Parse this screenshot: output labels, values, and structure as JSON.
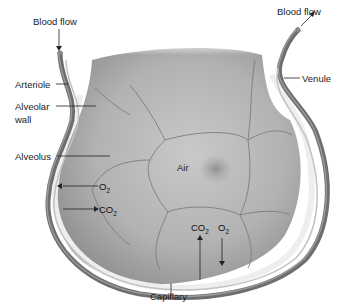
{
  "diagram": {
    "labels": {
      "blood_flow_in": "Blood flow",
      "blood_flow_out": "Blood flow",
      "arteriole": "Arteriole",
      "alveolar_wall_line1": "Alveolar",
      "alveolar_wall_line2": "wall",
      "alveolus": "Alveolus",
      "air": "Air",
      "venule": "Venule",
      "capillary": "Capillary"
    },
    "gas_exchange": {
      "left": [
        {
          "base": "O",
          "sub": "2",
          "direction": "into-blood"
        },
        {
          "base": "CO",
          "sub": "2",
          "direction": "into-alveolus"
        }
      ],
      "bottom": [
        {
          "base": "CO",
          "sub": "2",
          "direction": "into-alveolus"
        },
        {
          "base": "O",
          "sub": "2",
          "direction": "into-blood"
        }
      ]
    },
    "colors": {
      "vessel": "#6e6e6e",
      "vessel_highlight": "#9a9a9a",
      "alveolus_fill": "#a8a8a8",
      "cell_line": "#7a7a7a",
      "wall": "#e8e8e8",
      "label_text": "#222222"
    }
  }
}
